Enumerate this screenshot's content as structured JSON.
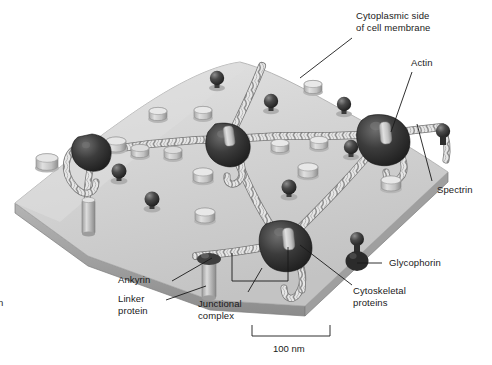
{
  "figure": {
    "background_color": "#ffffff",
    "width": 492,
    "height": 365
  },
  "labels": {
    "cytoplasmic_side": "Cytoplasmic side\nof cell membrane",
    "actin": "Actin",
    "spectrin": "Spectrin",
    "glycophorin": "Glycophorin",
    "cytoskeletal_proteins": "Cytoskeletal\nproteins",
    "ankyrin": "Ankyrin",
    "linker_protein": "Linker\nprotein",
    "junctional_complex": "Junctional\ncomplex"
  },
  "scale_bar": {
    "value": "100 nm",
    "x_start": 252,
    "x_end": 330,
    "y": 333
  },
  "edge_fragment": {
    "text": "n"
  },
  "colors": {
    "membrane_top": "#d2d2d2",
    "membrane_top_light": "#e2e2e2",
    "membrane_edge": "#b0b0b0",
    "membrane_side": "#9a9a9a",
    "spectrin_rope": "#e8e8e8",
    "spectrin_rope_shade": "#9c9c9c",
    "actin_node": "#3a3a3a",
    "glycophorin": "#2b2b2b",
    "cylinder_light": "#c9c9c9",
    "cylinder_shade": "#8e8e8e",
    "leader_line": "#1a1a1a",
    "text": "#1a1a1a"
  },
  "structures": {
    "glycophorin_spheres": [
      {
        "x": 217,
        "y": 80
      },
      {
        "x": 271,
        "y": 103
      },
      {
        "x": 344,
        "y": 106
      },
      {
        "x": 119,
        "y": 173
      },
      {
        "x": 152,
        "y": 201
      },
      {
        "x": 241,
        "y": 149
      },
      {
        "x": 289,
        "y": 189
      },
      {
        "x": 351,
        "y": 149
      },
      {
        "x": 357,
        "y": 239
      },
      {
        "x": 443,
        "y": 131
      }
    ],
    "cylinder_proteins": [
      {
        "x": 158,
        "y": 116
      },
      {
        "x": 203,
        "y": 114
      },
      {
        "x": 313,
        "y": 89
      },
      {
        "x": 47,
        "y": 164
      },
      {
        "x": 116,
        "y": 147
      },
      {
        "x": 203,
        "y": 177
      },
      {
        "x": 280,
        "y": 148
      },
      {
        "x": 319,
        "y": 145
      },
      {
        "x": 308,
        "y": 169
      },
      {
        "x": 391,
        "y": 185
      },
      {
        "x": 205,
        "y": 217
      },
      {
        "x": 140,
        "y": 152
      },
      {
        "x": 173,
        "y": 155
      }
    ],
    "junction_nodes": [
      {
        "x": 229,
        "y": 139,
        "name": "actin-junction-upper-left"
      },
      {
        "x": 385,
        "y": 134,
        "name": "actin-junction-upper-right"
      },
      {
        "x": 92,
        "y": 152,
        "name": "actin-junction-left"
      },
      {
        "x": 288,
        "y": 241,
        "name": "actin-junction-lower"
      }
    ],
    "linker_proteins": [
      {
        "x": 88,
        "y": 205
      },
      {
        "x": 208,
        "y": 265
      }
    ]
  },
  "leaders": {
    "cytoplasmic_side": {
      "x1": 352,
      "y1": 38,
      "x2": 300,
      "y2": 78
    },
    "actin": {
      "x1": 412,
      "y1": 72,
      "x2": 391,
      "y2": 132
    },
    "spectrin": {
      "x1": 432,
      "y1": 180,
      "x2": 417,
      "y2": 124
    },
    "glycophorin": {
      "x1": 382,
      "y1": 263,
      "x2": 358,
      "y2": 263
    },
    "cytoskeletal": {
      "x1": 355,
      "y1": 285,
      "x2": 300,
      "y2": 245
    },
    "ankyrin": {
      "x1": 172,
      "y1": 281,
      "x2": 213,
      "y2": 258
    },
    "linker_protein": {
      "x1": 168,
      "y1": 297,
      "x2": 206,
      "y2": 283
    },
    "junctional_complex": {
      "x1": 248,
      "y1": 292,
      "x2": 262,
      "y2": 268
    }
  }
}
